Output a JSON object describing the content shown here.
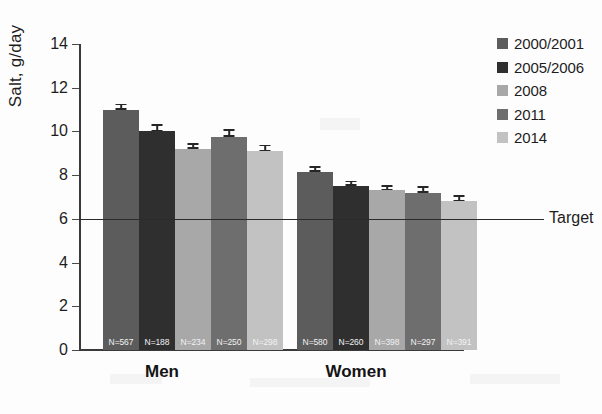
{
  "chart_data": {
    "type": "bar",
    "title": "",
    "xlabel": "",
    "ylabel": "Salt, g/day",
    "ylim": [
      0,
      14
    ],
    "yticks": [
      0,
      2,
      4,
      6,
      8,
      10,
      12,
      14
    ],
    "grid": false,
    "legend_position": "right",
    "categories": [
      "Men",
      "Women"
    ],
    "series": [
      {
        "name": "2000/2001",
        "color": "#5c5c5c",
        "values": [
          11.0,
          8.15
        ],
        "errors": [
          0.2,
          0.2
        ],
        "n_labels": [
          "N=567",
          "N=580"
        ]
      },
      {
        "name": "2005/2006",
        "color": "#2f2f2f",
        "values": [
          10.0,
          7.5
        ],
        "errors": [
          0.25,
          0.18
        ],
        "n_labels": [
          "N=188",
          "N=260"
        ]
      },
      {
        "name": "2008",
        "color": "#a8a8a8",
        "values": [
          9.2,
          7.3
        ],
        "errors": [
          0.18,
          0.17
        ],
        "n_labels": [
          "N=234",
          "N=398"
        ]
      },
      {
        "name": "2011",
        "color": "#6e6e6e",
        "values": [
          9.75,
          7.2
        ],
        "errors": [
          0.28,
          0.22
        ],
        "n_labels": [
          "N=250",
          "N=297"
        ]
      },
      {
        "name": "2014",
        "color": "#c2c2c2",
        "values": [
          9.1,
          6.8
        ],
        "errors": [
          0.22,
          0.2
        ],
        "n_labels": [
          "N=298",
          "N=391"
        ]
      }
    ],
    "annotations": [
      {
        "label": "Target",
        "value": 6,
        "type": "horizontal-line"
      }
    ]
  },
  "legend": {
    "entries": [
      {
        "label": "2000/2001"
      },
      {
        "label": "2005/2006"
      },
      {
        "label": "2008"
      },
      {
        "label": "2011"
      },
      {
        "label": "2014"
      }
    ]
  },
  "axis": {
    "ylabel": "Salt, g/day",
    "ytick_labels": [
      "14",
      "12",
      "10",
      "8",
      "6",
      "4",
      "2",
      "0"
    ],
    "category_labels": [
      "Men",
      "Women"
    ]
  },
  "target": {
    "label": "Target"
  }
}
